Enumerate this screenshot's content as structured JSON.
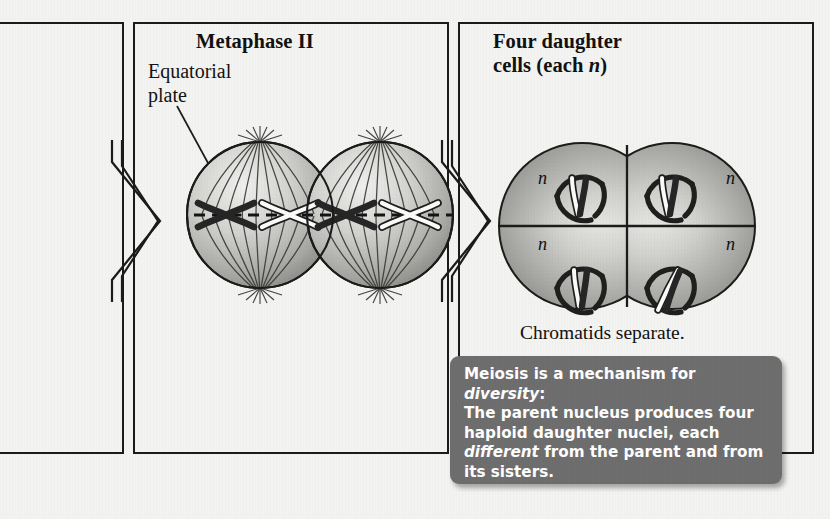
{
  "figure": {
    "kind": "meiosis-diagram",
    "background_color": "#f3f3f1",
    "panel_border_color": "#1b1b1b"
  },
  "panels": [
    {
      "id": "partial-left",
      "title": "",
      "subtitle": ""
    },
    {
      "id": "metaphase-ii",
      "title": "Metaphase II",
      "label": "Equatorial\nplate",
      "label_line1": "Equatorial",
      "label_line2": "plate"
    },
    {
      "id": "four-daughter-cells",
      "title_line1": "Four daughter",
      "title_line2": "cells (each n)",
      "title_plain": "Four daughter cells (each n)"
    }
  ],
  "daughter_cells": {
    "caption": "Chromatids separate.",
    "ploidy_label": "n",
    "cells": [
      {
        "position": "top-left",
        "label": "n",
        "label_side": "left",
        "chromatids": "vertical-pair"
      },
      {
        "position": "top-right",
        "label": "n",
        "label_side": "right",
        "chromatids": "vertical-pair"
      },
      {
        "position": "bottom-left",
        "label": "n",
        "label_side": "left",
        "chromatids": "vertical-pair"
      },
      {
        "position": "bottom-right",
        "label": "n",
        "label_side": "right",
        "chromatids": "slanted-pair"
      }
    ]
  },
  "callout": {
    "lines": [
      "Meiosis is a mechanism for diversity:",
      "The parent nucleus produces four",
      "haploid daughter nuclei, each",
      "different from the parent and from",
      "its sisters."
    ],
    "line1_pre": "Meiosis is a mechanism for ",
    "line1_em": "diversity",
    "line1_post": ":",
    "line2": "The parent nucleus produces four",
    "line3": "haploid daughter nuclei, each",
    "line4_em": "different",
    "line4_post": " from the parent and from",
    "line5": "its sisters.",
    "background_color": "#6e6e6e",
    "text_color": "#ffffff"
  },
  "colors": {
    "cell_light": "#e9e9e7",
    "cell_mid": "#b9b9b6",
    "cell_dark": "#8d8d8a",
    "outline": "#1c1c1c",
    "chromosome_dark": "#262626",
    "chromosome_light": "#fbfbfa"
  }
}
